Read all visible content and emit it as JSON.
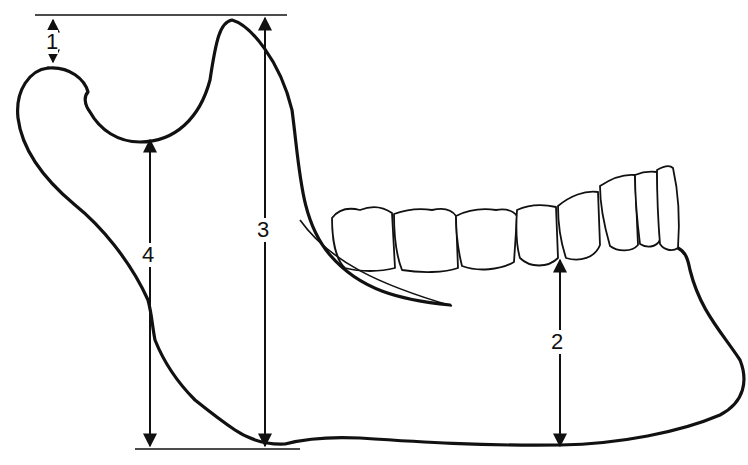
{
  "diagram": {
    "measurements": [
      {
        "id": "1",
        "label": "1"
      },
      {
        "id": "2",
        "label": "2"
      },
      {
        "id": "3",
        "label": "3"
      },
      {
        "id": "4",
        "label": "4"
      }
    ],
    "colors": {
      "line": "#111111",
      "background": "#ffffff"
    }
  }
}
